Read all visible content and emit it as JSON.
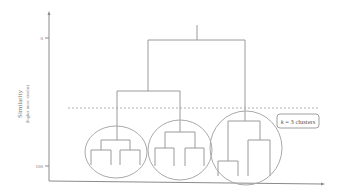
{
  "diagram": {
    "type": "dendrogram",
    "y_axis": {
      "label": "Similarity",
      "sublabel": "(higher more similar)",
      "ticks": [
        {
          "value": "0",
          "y": 38
        },
        {
          "value": "100",
          "y": 166
        }
      ]
    },
    "cut_line": {
      "style": "dashed",
      "y": 108
    },
    "annotation": {
      "k": "k",
      "text": " = 3 clusters"
    },
    "clusters": [
      {
        "name": "cluster-1",
        "leaves": 4
      },
      {
        "name": "cluster-2",
        "leaves": 4
      },
      {
        "name": "cluster-3",
        "leaves": 4
      }
    ],
    "colors": {
      "lines": "#9a9a9a",
      "axis": "#8a8a8a",
      "background": "#ffffff"
    }
  }
}
